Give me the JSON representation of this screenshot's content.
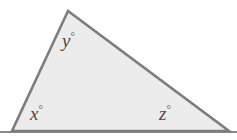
{
  "figure": {
    "type": "geometry-diagram",
    "shape": "triangle",
    "canvas": {
      "width": 237,
      "height": 140
    },
    "colors": {
      "background": "#ffffff",
      "fill": "#ececec",
      "stroke": "#7d7d7d",
      "label_text": "#4a4a4a",
      "baseline": "#8a8a8a"
    },
    "vertices": [
      {
        "name": "apex",
        "x": 68,
        "y": 11,
        "angle_label": "y"
      },
      {
        "name": "bottom-left",
        "x": 12,
        "y": 131,
        "angle_label": "x"
      },
      {
        "name": "bottom-right",
        "x": 229,
        "y": 131,
        "angle_label": "z"
      }
    ],
    "baseline": {
      "y": 132,
      "x_start": 0,
      "x_end": 237
    },
    "labels": {
      "y": {
        "variable": "y",
        "degree_symbol": "°",
        "text": "y°"
      },
      "x": {
        "variable": "x",
        "degree_symbol": "°",
        "text": "x°"
      },
      "z": {
        "variable": "z",
        "degree_symbol": "°",
        "text": "z°"
      }
    }
  }
}
